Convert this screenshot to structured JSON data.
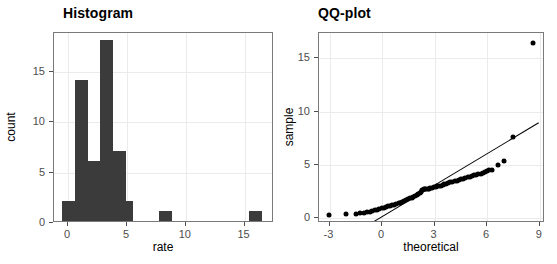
{
  "figure": {
    "background": "#ffffff",
    "panel_border_color": "#7a7a7a",
    "grid_color": "#ebebeb",
    "ink_color": "#3b3b3b",
    "point_color": "#000000"
  },
  "panels": [
    {
      "id": "histogram",
      "title": "Histogram",
      "xlabel": "rate",
      "ylabel": "count"
    },
    {
      "id": "qqplot",
      "title": "QQ-plot",
      "xlabel": "theoretical",
      "ylabel": "sample"
    }
  ],
  "chart_data": [
    {
      "type": "bar",
      "title": "Histogram",
      "xlabel": "rate",
      "ylabel": "count",
      "xlim": [
        -1.2,
        17.5
      ],
      "ylim": [
        0,
        18.9
      ],
      "xticks": [
        0,
        5,
        10,
        15
      ],
      "yticks": [
        0,
        5,
        10,
        15
      ],
      "xtick_labels": [
        "0",
        "5",
        "10",
        "15"
      ],
      "ytick_labels": [
        "0",
        "5",
        "10",
        "15"
      ],
      "grid": true,
      "legend": "none",
      "bin_width": 1.1,
      "bins": [
        {
          "x0": -0.55,
          "x1": 0.55,
          "count": 2
        },
        {
          "x0": 0.55,
          "x1": 1.65,
          "count": 14
        },
        {
          "x0": 1.65,
          "x1": 2.75,
          "count": 6
        },
        {
          "x0": 2.75,
          "x1": 3.85,
          "count": 18
        },
        {
          "x0": 3.85,
          "x1": 4.95,
          "count": 7
        },
        {
          "x0": 4.95,
          "x1": 5.5,
          "count": 2
        },
        {
          "x0": 7.7,
          "x1": 8.8,
          "count": 1
        },
        {
          "x0": 15.4,
          "x1": 16.5,
          "count": 1
        }
      ],
      "categories": [
        "0",
        "1.1",
        "2.2",
        "3.3",
        "4.4",
        "5.5",
        "8.25",
        "15.95"
      ],
      "values": [
        2,
        14,
        6,
        18,
        7,
        2,
        1,
        1
      ]
    },
    {
      "type": "scatter",
      "title": "QQ-plot",
      "xlabel": "theoretical",
      "ylabel": "sample",
      "xlim": [
        -3.6,
        9.3
      ],
      "ylim": [
        -0.5,
        17.4
      ],
      "xticks": [
        -3,
        0,
        3,
        6,
        9
      ],
      "yticks": [
        0,
        5,
        10,
        15
      ],
      "xtick_labels": [
        "-3",
        "0",
        "3",
        "6",
        "9"
      ],
      "ytick_labels": [
        "0",
        "5",
        "10",
        "15"
      ],
      "grid": true,
      "legend": "none",
      "reference_line": {
        "x0": -0.45,
        "y0": -0.35,
        "x1": 8.95,
        "y1": 8.95
      },
      "x": [
        -3.05,
        -2.05,
        -1.5,
        -1.25,
        -1.05,
        -0.85,
        -0.7,
        -0.55,
        -0.4,
        -0.28,
        -0.15,
        -0.02,
        0.1,
        0.22,
        0.34,
        0.46,
        0.58,
        0.7,
        0.82,
        0.94,
        1.05,
        1.16,
        1.27,
        1.38,
        1.48,
        1.58,
        1.68,
        1.78,
        1.88,
        1.98,
        2.07,
        2.16,
        2.25,
        2.3,
        2.38,
        2.45,
        2.52,
        2.6,
        2.68,
        2.76,
        2.85,
        2.95,
        3.05,
        3.15,
        3.25,
        3.35,
        3.45,
        3.56,
        3.67,
        3.78,
        3.9,
        4.02,
        4.14,
        4.26,
        4.38,
        4.5,
        4.62,
        4.75,
        4.88,
        5.0,
        5.12,
        5.25,
        5.38,
        5.5,
        5.62,
        5.74,
        5.86,
        6.0,
        6.12,
        6.3,
        6.6,
        6.95,
        7.45,
        8.6
      ],
      "y": [
        0.3,
        0.32,
        0.36,
        0.42,
        0.48,
        0.52,
        0.58,
        0.64,
        0.7,
        0.76,
        0.82,
        0.88,
        0.94,
        1.0,
        1.06,
        1.12,
        1.18,
        1.24,
        1.3,
        1.36,
        1.42,
        1.5,
        1.58,
        1.66,
        1.74,
        1.82,
        1.9,
        1.98,
        2.06,
        2.14,
        2.22,
        2.3,
        2.38,
        2.62,
        2.66,
        2.68,
        2.7,
        2.72,
        2.75,
        2.78,
        2.82,
        2.86,
        2.9,
        2.94,
        2.98,
        3.02,
        3.08,
        3.14,
        3.2,
        3.26,
        3.32,
        3.38,
        3.44,
        3.5,
        3.56,
        3.62,
        3.68,
        3.74,
        3.8,
        3.86,
        3.92,
        3.98,
        4.04,
        4.1,
        4.16,
        4.22,
        4.3,
        4.4,
        4.48,
        4.5,
        5.0,
        5.3,
        7.6,
        16.5
      ]
    }
  ]
}
